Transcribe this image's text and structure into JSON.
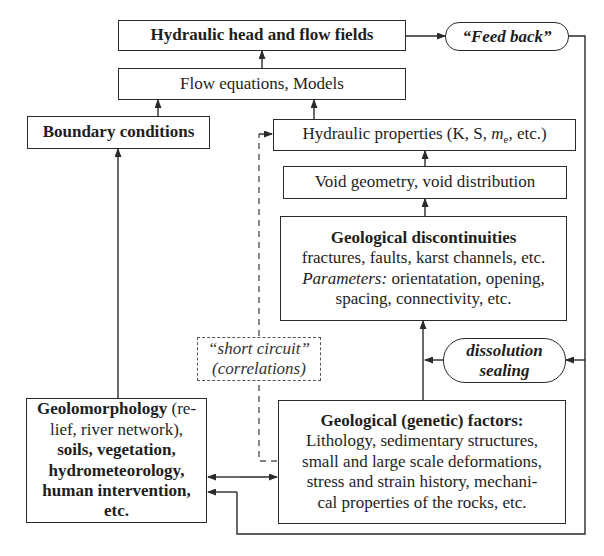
{
  "diagram": {
    "nodes": {
      "hydraulic_head": {
        "label": "Hydraulic head and flow fields"
      },
      "feed_back": {
        "label": "“Feed back”"
      },
      "flow_equations": {
        "label": "Flow equations, Models"
      },
      "boundary_conditions": {
        "label": "Boundary conditions"
      },
      "hydraulic_properties": {
        "label_pre": "Hydraulic properties (K, S, ",
        "label_var": "m",
        "label_sub": "e",
        "label_post": ", etc.)"
      },
      "void_geometry": {
        "label": "Void geometry, void distribution"
      },
      "geological_discontinuities": {
        "title": "Geological discontinuities",
        "line1": "fractures, faults, karst channels, etc.",
        "params_label": "Parameters:",
        "params_text": " orientatation, opening,",
        "line3": "spacing, connectivity, etc."
      },
      "short_circuit": {
        "line1": "“short circuit”",
        "line2": "(correlations)"
      },
      "dissolution_sealing": {
        "line1": "dissolution",
        "line2": "sealing"
      },
      "geomorphology": {
        "bold1": "Geolomorphology",
        "normal1": " (re-",
        "normal2": "lief, river network),",
        "bold2": "soils, vegetation,",
        "bold3": "hydrometeorology,",
        "bold4": "human intervention,",
        "bold5": "etc."
      },
      "genetic_factors": {
        "title": "Geological (genetic) factors:",
        "line1": "Lithology, sedimentary structures,",
        "line2": "small and large scale deformations,",
        "line3": "stress and strain history, mechani-",
        "line4": "cal properties of the rocks, etc."
      }
    },
    "edges": [
      {
        "from": "flow_equations",
        "to": "hydraulic_head"
      },
      {
        "from": "hydraulic_head",
        "to": "feed_back"
      },
      {
        "from": "boundary_conditions",
        "to": "flow_equations"
      },
      {
        "from": "hydraulic_properties",
        "to": "flow_equations"
      },
      {
        "from": "void_geometry",
        "to": "hydraulic_properties"
      },
      {
        "from": "geological_discontinuities",
        "to": "void_geometry"
      },
      {
        "from": "genetic_factors",
        "to": "geological_discontinuities"
      },
      {
        "from": "geomorphology",
        "to": "boundary_conditions"
      },
      {
        "from": "geomorphology",
        "to": "genetic_factors",
        "bidirectional": true
      },
      {
        "from": "feed_back",
        "to": "dissolution_sealing"
      },
      {
        "from": "dissolution_sealing",
        "to": "genetic_factors_line"
      },
      {
        "from": "feed_back",
        "to": "geomorphology"
      },
      {
        "from": "genetic_factors",
        "to": "hydraulic_properties",
        "style": "dashed",
        "via": "short_circuit"
      }
    ],
    "colors": {
      "line": "#2a2a2a",
      "dashed": "#555555",
      "background": "#ffffff"
    }
  }
}
